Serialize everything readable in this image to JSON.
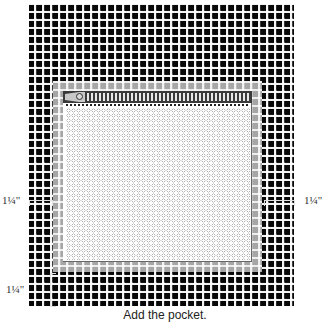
{
  "figure": {
    "caption": "Add the pocket.",
    "labels": {
      "left_seam_allowance": "1¼\"",
      "right_seam_allowance": "1¼\"",
      "bottom_seam_allowance": "1¼\""
    },
    "parts": {
      "fabric": "plaid-fabric",
      "pocket": "zippered-pocket",
      "zipper": "zipper"
    },
    "colors": {
      "fabric_dark": "#1a1a1a",
      "fabric_light": "#ffffff",
      "pocket_band": "#bdbdbd",
      "pocket_panel": "#ffffff",
      "zipper": "#3a3a3a"
    }
  }
}
